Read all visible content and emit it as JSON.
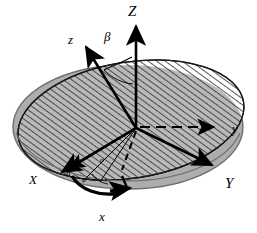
{
  "figure": {
    "type": "3d-coordinate-diagram"
  },
  "colors": {
    "stroke": "#000000",
    "background": "#ffffff",
    "plane_fill": "#adadad",
    "plane_edge": "#6e6e6e",
    "hatch_line": "#3a3a3a",
    "hatch_bg": "#b4b4b4",
    "hatch_bg_white": "#ffffff"
  },
  "labels": {
    "axis_Z": "Z",
    "axis_z": "z",
    "axis_Y": "Y",
    "axis_y": "y",
    "axis_X": "X",
    "axis_x": "x",
    "angle_beta": "β",
    "angle_alpha": "α",
    "angle_gamma": "γ",
    "angle_phi": "φ",
    "node_n": "n"
  },
  "elements": {
    "fixed_frame": {
      "name": "XYZ fixed reference frame",
      "axes": [
        "X",
        "Y",
        "Z"
      ],
      "z_axis_style": "solid-arrow",
      "y_axis_style": "dashed-arrow",
      "x_axis_style": "solid-arrow"
    },
    "body_frame": {
      "name": "xyz body reference frame",
      "axes": [
        "x",
        "y",
        "z"
      ],
      "z_axis_style": "solid-arrow",
      "y_axis_style": "solid-arrow",
      "x_axis_style": "solid-arrow"
    },
    "planes": [
      {
        "name": "XY-plane disk",
        "fill": "solid-gray",
        "shape": "ellipse"
      },
      {
        "name": "xy-plane disk",
        "fill": "hatched",
        "shape": "ellipse"
      }
    ],
    "arcs": [
      {
        "name": "beta-arc",
        "between": [
          "Z",
          "z"
        ],
        "label": "β"
      },
      {
        "name": "phi-arc",
        "between": [
          "X",
          "x"
        ],
        "label": "φ"
      },
      {
        "name": "alpha-arc",
        "label": "α"
      },
      {
        "name": "gamma-arc",
        "label": "γ"
      }
    ]
  },
  "label_positions": {
    "Z": {
      "x": 128,
      "y": 6
    },
    "z": {
      "x": 68,
      "y": 34
    },
    "beta": {
      "x": 104,
      "y": 32
    },
    "y": {
      "x": 232,
      "y": 127
    },
    "Y": {
      "x": 226,
      "y": 180
    },
    "X": {
      "x": 31,
      "y": 175
    },
    "x": {
      "x": 100,
      "y": 213
    },
    "n": {
      "x": 66,
      "y": 172
    },
    "phi": {
      "x": 83,
      "y": 180
    },
    "gamma": {
      "x": 104,
      "y": 178
    },
    "alpha": {
      "x": 101,
      "y": 160
    }
  }
}
